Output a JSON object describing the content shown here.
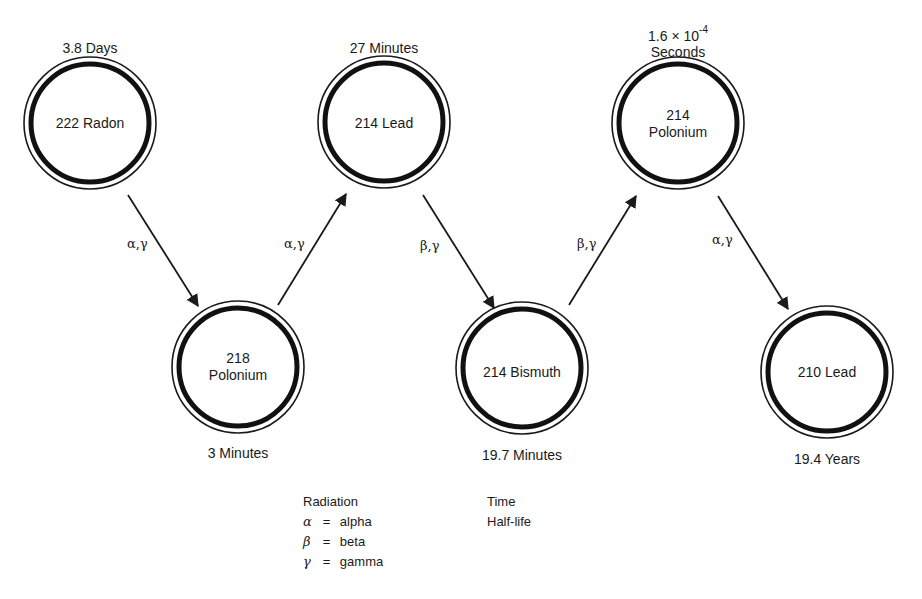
{
  "nodes": [
    {
      "id": "radon-222",
      "line1": "222 Radon",
      "line2": "",
      "half_life": "3.8 Days",
      "cx": 90,
      "cy": 123,
      "label_pos": "top"
    },
    {
      "id": "polonium-218",
      "line1": "218",
      "line2": "Polonium",
      "half_life": "3 Minutes",
      "cx": 238,
      "cy": 367,
      "label_pos": "bottom"
    },
    {
      "id": "lead-214",
      "line1": "214 Lead",
      "line2": "",
      "half_life": "27 Minutes",
      "cx": 384,
      "cy": 122,
      "label_pos": "top"
    },
    {
      "id": "bismuth-214",
      "line1": "214 Bismuth",
      "line2": "",
      "half_life": "19.7 Minutes",
      "cx": 522,
      "cy": 368,
      "label_pos": "bottom"
    },
    {
      "id": "polonium-214",
      "line1": "214",
      "line2": "Polonium",
      "half_life_base": "1.6 × 10",
      "half_life_exp": "-4",
      "half_life_unit": "Seconds",
      "cx": 678,
      "cy": 123,
      "label_pos": "top"
    },
    {
      "id": "lead-210",
      "line1": "210 Lead",
      "line2": "",
      "half_life": "19.4 Years",
      "cx": 827,
      "cy": 372,
      "label_pos": "bottom"
    }
  ],
  "transitions": [
    {
      "from": "radon-222",
      "to": "polonium-218",
      "label": "α,γ"
    },
    {
      "from": "polonium-218",
      "to": "lead-214",
      "label": "α,γ"
    },
    {
      "from": "lead-214",
      "to": "bismuth-214",
      "label": "β,γ"
    },
    {
      "from": "bismuth-214",
      "to": "polonium-214",
      "label": "β,γ"
    },
    {
      "from": "polonium-214",
      "to": "lead-210",
      "label": "α,γ"
    }
  ],
  "legend": {
    "radiation_title": "Radiation",
    "items": [
      {
        "symbol": "α",
        "eq": "=",
        "name": "alpha"
      },
      {
        "symbol": "β",
        "eq": "=",
        "name": "beta"
      },
      {
        "symbol": "γ",
        "eq": "=",
        "name": "gamma"
      }
    ],
    "time_title": "Time",
    "time_subtitle": "Half-life"
  }
}
